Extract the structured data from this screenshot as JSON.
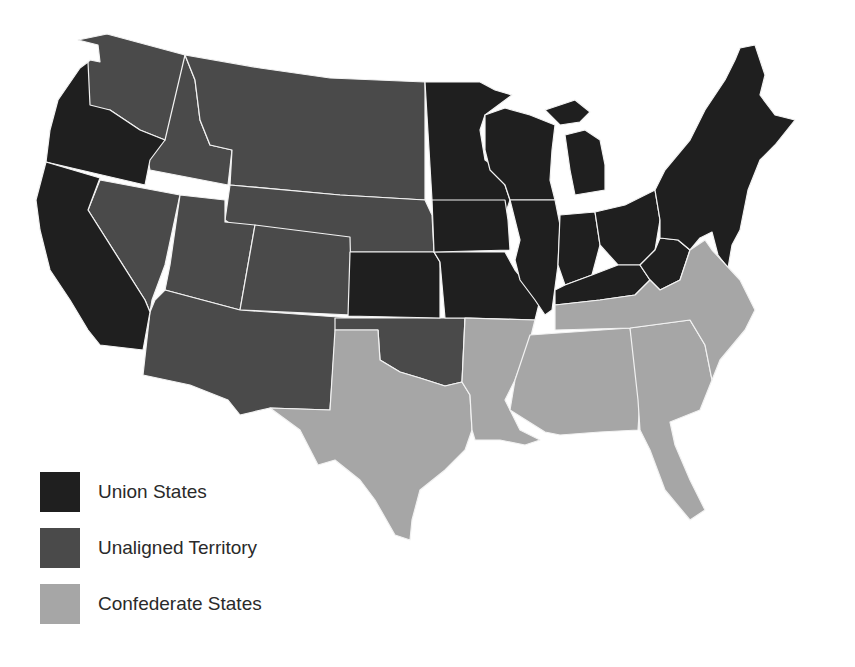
{
  "map": {
    "regions": {
      "union": {
        "label": "Union States",
        "color": "#1f1f1f"
      },
      "unaligned": {
        "label": "Unaligned Territory",
        "color": "#4a4a4a"
      },
      "confederate": {
        "label": "Confederate States",
        "color": "#a6a6a6"
      }
    }
  },
  "legend": {
    "items": [
      {
        "label": "Union States",
        "color": "#1f1f1f"
      },
      {
        "label": "Unaligned Territory",
        "color": "#4a4a4a"
      },
      {
        "label": "Confederate States",
        "color": "#a6a6a6"
      }
    ]
  }
}
